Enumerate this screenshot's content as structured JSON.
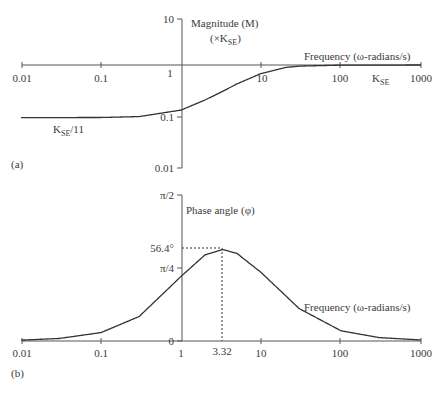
{
  "chart_data": [
    {
      "type": "line",
      "panel_label": "(a)",
      "title": "",
      "ylabel": "Magnitude (M)",
      "ylabel_sub": "(×K",
      "ylabel_sub_subscript": "SE",
      "ylabel_sub_end": ")",
      "xlabel": "Frequency (ω-radians/s)",
      "xscale": "log",
      "yscale": "log",
      "xlim": [
        0.01,
        1000
      ],
      "ylim": [
        0.01,
        10
      ],
      "x_ticks": [
        "0.01",
        "0.1",
        "1",
        "10",
        "100",
        "1000"
      ],
      "y_ticks": [
        "10",
        "1",
        "0.1",
        "0.01"
      ],
      "annotations": [
        {
          "text": "K",
          "sub": "SE",
          "suffix": "/11",
          "desc": "low-frequency asymptote"
        },
        {
          "text": "K",
          "sub": "SE",
          "suffix": "",
          "desc": "high-frequency asymptote"
        }
      ],
      "series": [
        {
          "name": "Magnitude",
          "x": [
            0.01,
            0.1,
            0.3,
            1,
            2,
            3.32,
            5,
            10,
            20,
            30,
            100,
            1000
          ],
          "y": [
            0.0909,
            0.0913,
            0.0952,
            0.128,
            0.203,
            0.3015,
            0.4213,
            0.678,
            0.892,
            0.95,
            0.994,
            1.0
          ]
        }
      ]
    },
    {
      "type": "line",
      "panel_label": "(b)",
      "title": "",
      "ylabel": "Phase angle (φ)",
      "xlabel": "Frequency (ω-radians/s)",
      "xscale": "log",
      "xlim": [
        0.01,
        1000
      ],
      "ylim": [
        0,
        1.5708
      ],
      "x_ticks": [
        "0.01",
        "0.1",
        "1",
        "3.32",
        "10",
        "100",
        "1000"
      ],
      "y_ticks": [
        "π/2",
        "56.4°",
        "π/4",
        "0"
      ],
      "annotations": [
        {
          "text": "56.4°",
          "x": 3.32,
          "desc": "maximum phase lead at ω = 3.32"
        }
      ],
      "series": [
        {
          "name": "Phase",
          "x": [
            0.01,
            0.03,
            0.1,
            0.3,
            1,
            2,
            3.32,
            5,
            10,
            30,
            100,
            300,
            1000
          ],
          "y_deg": [
            0.52,
            1.56,
            5.19,
            15.1,
            39.8,
            53.1,
            56.4,
            54.0,
            42.3,
            20.0,
            6.3,
            2.1,
            0.63
          ]
        }
      ]
    }
  ],
  "labels": {
    "a": {
      "panel": "(a)",
      "ylabel": "Magnitude (M)",
      "ylabel2_pre": "(×K",
      "ylabel2_sub": "SE",
      "ylabel2_post": ")",
      "xlabel": "Frequency (ω-radians/s)",
      "low_K": "K",
      "low_sub": "SE",
      "low_post": "/11",
      "high_K": "K",
      "high_sub": "SE",
      "xt0": "0.01",
      "xt1": "0.1",
      "xt2": "1",
      "xt3": "10",
      "xt4": "100",
      "xt5": "1000",
      "yt0": "10",
      "yt1": "1",
      "yt2": "0.1",
      "yt3": "0.01"
    },
    "b": {
      "panel": "(b)",
      "ylabel": "Phase angle (φ)",
      "xlabel": "Frequency (ω-radians/s)",
      "xt0": "0.01",
      "xt1": "0.1",
      "xt2": "1",
      "xt3": "3.32",
      "xt4": "10",
      "xt5": "100",
      "xt6": "1000",
      "yt0": "π/2",
      "yt1": "56.4°",
      "yt2": "π/4",
      "yt3": "0"
    }
  }
}
